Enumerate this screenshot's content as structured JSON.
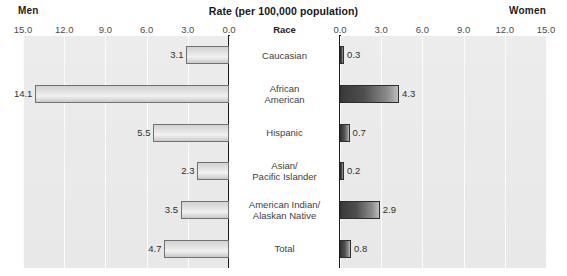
{
  "header": {
    "left_label": "Men",
    "right_label": "Women",
    "title": "Rate (per 100,000 population)"
  },
  "center_header": "Race",
  "chart_data": {
    "type": "bar",
    "title": "Rate (per 100,000 population)",
    "xlabel": "Rate (per 100,000 population)",
    "ylabel": "Race",
    "orientation": "horizontal",
    "layout": "diverging-pyramid",
    "grid": true,
    "legend": "none",
    "xlim_left": [
      15.0,
      0.0
    ],
    "xlim_right": [
      0.0,
      15.0
    ],
    "left_ticks": [
      "15.0",
      "12.0",
      "9.0",
      "6.0",
      "3.0",
      "0.0"
    ],
    "right_ticks": [
      "0.0",
      "3.0",
      "6.0",
      "9.0",
      "12.0",
      "15.0"
    ],
    "tick_values_left": [
      15.0,
      12.0,
      9.0,
      6.0,
      3.0,
      0.0
    ],
    "tick_values_right": [
      0.0,
      3.0,
      6.0,
      9.0,
      12.0,
      15.0
    ],
    "categories": [
      "Caucasian",
      "African American",
      "Hispanic",
      "Asian/ Pacific Islander",
      "American Indian/ Alaskan Native",
      "Total"
    ],
    "category_lines": [
      [
        "Caucasian"
      ],
      [
        "African",
        "American"
      ],
      [
        "Hispanic"
      ],
      [
        "Asian/",
        "Pacific Islander"
      ],
      [
        "American Indian/",
        "Alaskan Native"
      ],
      [
        "Total"
      ]
    ],
    "series": [
      {
        "name": "Men",
        "values": [
          3.1,
          14.1,
          5.5,
          2.3,
          3.5,
          4.7
        ]
      },
      {
        "name": "Women",
        "values": [
          0.3,
          4.3,
          0.7,
          0.2,
          2.9,
          0.8
        ]
      }
    ],
    "value_labels_left": [
      "3.1",
      "14.1",
      "5.5",
      "2.3",
      "3.5",
      "4.7"
    ],
    "value_labels_right": [
      "0.3",
      "4.3",
      "0.7",
      "0.2",
      "2.9",
      "0.8"
    ]
  },
  "colors": {
    "men_bar": "#e0e0e0",
    "women_bar": "#3f3f3f",
    "plot_background": "#ebebeb",
    "gridline": "#fbfbfb",
    "axis": "#1c1c1c",
    "text": "#3a3a3a"
  }
}
